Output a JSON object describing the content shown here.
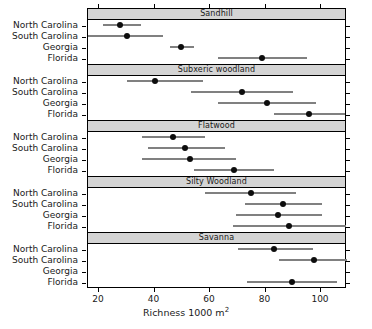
{
  "chart_data": {
    "type": "scatter",
    "title": "",
    "xlabel": "Richness 1000 m2",
    "xlabel_base": "Richness 1000 m",
    "xlabel_sup": "2",
    "ylabel": "",
    "xlim": [
      14,
      107
    ],
    "ylim": [
      0,
      4
    ],
    "grid": false,
    "legend": "none",
    "xticks": [
      20,
      40,
      60,
      80,
      100
    ],
    "xticklabels": [
      "20",
      "40",
      "60",
      "80",
      "100"
    ],
    "categories": [
      "North Carolina",
      "South Carolina",
      "Georgia",
      "Florida"
    ],
    "panels": [
      {
        "label": "Sandhill",
        "rows": [
          {
            "category": "North Carolina",
            "value": 28.0,
            "low": 21.8,
            "high": 35.5
          },
          {
            "category": "South Carolina",
            "value": 30.5,
            "low": 15.0,
            "high": 43.5
          },
          {
            "category": "Georgia",
            "value": 50.0,
            "low": 46.0,
            "high": 54.5
          },
          {
            "category": "Florida",
            "value": 79.0,
            "low": 63.2,
            "high": 95.3
          }
        ]
      },
      {
        "label": "Subxeric woodland",
        "rows": [
          {
            "category": "North Carolina",
            "value": 40.5,
            "low": 30.5,
            "high": 58.0
          },
          {
            "category": "South Carolina",
            "value": 72.0,
            "low": 53.5,
            "high": 90.3
          },
          {
            "category": "Georgia",
            "value": 81.0,
            "low": 63.2,
            "high": 98.5
          },
          {
            "category": "Florida",
            "value": 96.0,
            "low": 83.6,
            "high": 109.0
          }
        ]
      },
      {
        "label": "Flatwood",
        "rows": [
          {
            "category": "North Carolina",
            "value": 47.0,
            "low": 35.9,
            "high": 58.5
          },
          {
            "category": "South Carolina",
            "value": 51.5,
            "low": 38.0,
            "high": 65.8
          },
          {
            "category": "Georgia",
            "value": 53.0,
            "low": 35.9,
            "high": 69.7
          },
          {
            "category": "Florida",
            "value": 69.0,
            "low": 54.6,
            "high": 83.4
          }
        ]
      },
      {
        "label": "Silty Woodland",
        "rows": [
          {
            "category": "North Carolina",
            "value": 75.0,
            "low": 58.5,
            "high": 91.4
          },
          {
            "category": "South Carolina",
            "value": 86.5,
            "low": 73.0,
            "high": 100.7
          },
          {
            "category": "Georgia",
            "value": 85.0,
            "low": 69.7,
            "high": 100.7
          },
          {
            "category": "Florida",
            "value": 89.0,
            "low": 68.6,
            "high": 109.4
          }
        ]
      },
      {
        "label": "Savanna",
        "rows": [
          {
            "category": "North Carolina",
            "value": 83.5,
            "low": 70.4,
            "high": 97.5
          },
          {
            "category": "South Carolina",
            "value": 98.0,
            "low": 85.2,
            "high": 111.9
          },
          {
            "category": "Georgia",
            "value": null,
            "low": null,
            "high": null
          },
          {
            "category": "Florida",
            "value": 90.0,
            "low": 73.7,
            "high": 106.1
          }
        ]
      }
    ]
  },
  "colors": {
    "bar": "#808080",
    "dot": "#0d0d0d",
    "strip_background": "#d4d4d4",
    "frame": "#000000",
    "text": "#1a1a1a",
    "plot_background": "#ffffff"
  }
}
